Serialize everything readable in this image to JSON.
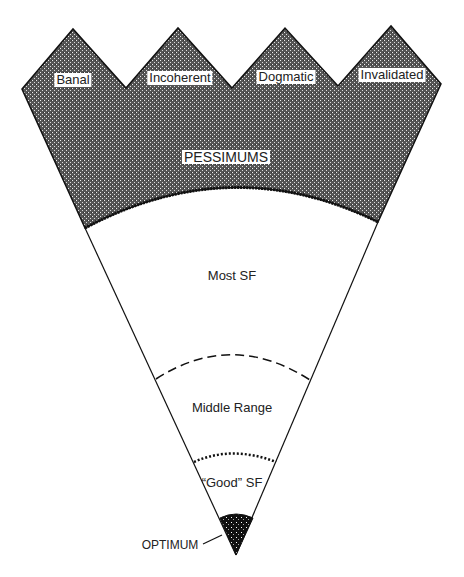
{
  "diagram": {
    "type": "cone-quality-diagram",
    "pessimum_categories": [
      {
        "label": "Banal"
      },
      {
        "label": "Incoherent"
      },
      {
        "label": "Dogmatic"
      },
      {
        "label": "Invalidated"
      }
    ],
    "pessimum_label": "PESSIMUMS",
    "zones": [
      {
        "label": "Most SF",
        "boundary_style": "solid-thick-curve"
      },
      {
        "label": "Middle Range",
        "boundary_style": "dashed-curve"
      },
      {
        "label": "“Good” SF",
        "boundary_style": "dotted-curve"
      }
    ],
    "optimum_label": "OPTIMUM",
    "colors": {
      "ink": "#111111",
      "paper": "#ffffff"
    }
  }
}
